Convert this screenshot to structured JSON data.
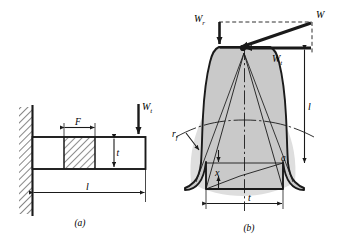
{
  "figure": {
    "kind": "engineering-diagram",
    "topic": "Lewis bending equation — cantilever beam analogy and gear tooth parabola",
    "background_color": "#ffffff",
    "line_color": "#1a1a1a",
    "tooth_fill_color": "#c9c9c9",
    "gear_body_shadow_color": "#dedede",
    "panels": [
      {
        "id": "a",
        "caption": "(a)",
        "description": "Cantilever beam of length l fixed in a hatched wall, rectangular cross section of thickness t, with a hatched critical section of face width F, loaded at the free end by the tangential load.",
        "labels": [
          {
            "name": "load-label",
            "text": "W",
            "subscript": "t"
          },
          {
            "name": "face-width-label",
            "text": "F",
            "subscript": ""
          },
          {
            "name": "thickness-label",
            "text": "t",
            "subscript": ""
          },
          {
            "name": "length-label",
            "text": "l",
            "subscript": ""
          }
        ]
      },
      {
        "id": "b",
        "caption": "(b)",
        "description": "Gear tooth profile with the resultant load W applied at the tip, resolved into radial and tangential components, an inscribed parabola of constant strength, fillet radius, and the critical section dimensions.",
        "labels": [
          {
            "name": "radial-component-label",
            "text": "W",
            "subscript": "r",
            "prime": true
          },
          {
            "name": "resultant-load-label",
            "text": "W",
            "subscript": "",
            "prime": true
          },
          {
            "name": "tangential-component-label",
            "text": "W",
            "subscript": "t",
            "prime": true
          },
          {
            "name": "moment-arm-label",
            "text": "l",
            "subscript": ""
          },
          {
            "name": "fillet-radius-label",
            "text": "r",
            "subscript": "f"
          },
          {
            "name": "parabola-offset-label",
            "text": "x",
            "subscript": ""
          },
          {
            "name": "pressure-angle-label",
            "text": "a",
            "subscript": ""
          },
          {
            "name": "tooth-thickness-label",
            "text": "t",
            "subscript": ""
          }
        ]
      }
    ]
  }
}
